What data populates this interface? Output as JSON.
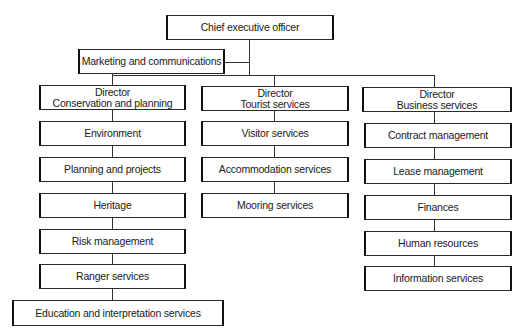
{
  "ceo": {
    "label": "Chief executive officer"
  },
  "marketing": {
    "label": "Marketing and communications"
  },
  "directors": [
    {
      "line1": "Director",
      "line2": "Conservation and planning",
      "units": [
        "Environment",
        "Planning and projects",
        "Heritage",
        "Risk management",
        "Ranger services",
        "Education and interpretation services"
      ]
    },
    {
      "line1": "Director",
      "line2": "Tourist services",
      "units": [
        "Visitor services",
        "Accommodation services",
        "Mooring services"
      ]
    },
    {
      "line1": "Director",
      "line2": "Business services",
      "units": [
        "Contract management",
        "Lease management",
        "Finances",
        "Human resources",
        "Information services"
      ]
    }
  ]
}
